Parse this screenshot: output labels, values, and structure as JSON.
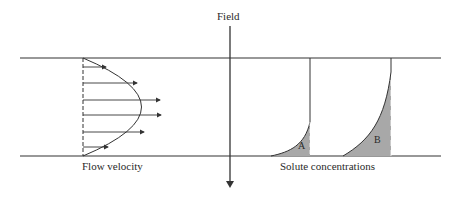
{
  "labels": {
    "field": "Field",
    "flow_velocity": "Flow velocity",
    "solute_concentrations": "Solute concentrations",
    "solute_a": "A",
    "solute_b": "B"
  },
  "colors": {
    "line": "#333333",
    "shade": "#a8a8a8",
    "background": "#ffffff"
  }
}
